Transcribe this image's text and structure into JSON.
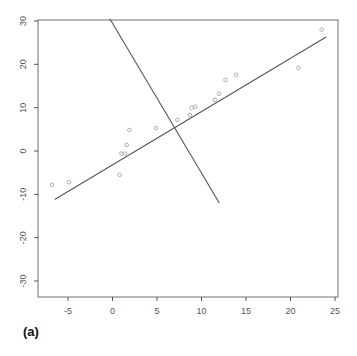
{
  "panel_label": "(a)",
  "colors": {
    "axis": "#555555",
    "box": "#888888",
    "line": "#555555",
    "point": "#999999"
  },
  "chart_data": {
    "type": "scatter",
    "title": "",
    "xlabel": "",
    "ylabel": "",
    "xlim": [
      -8,
      25.5
    ],
    "ylim": [
      -34,
      30.5
    ],
    "xticks": [
      -5,
      0,
      5,
      10,
      15,
      20,
      25
    ],
    "yticks": [
      -30,
      -20,
      -10,
      0,
      10,
      20,
      30
    ],
    "grid": false,
    "legend": null,
    "points": [
      {
        "x": -6.8,
        "y": -7.8
      },
      {
        "x": -4.9,
        "y": -7.2
      },
      {
        "x": 0.8,
        "y": -5.5
      },
      {
        "x": 1.0,
        "y": -0.6
      },
      {
        "x": 1.4,
        "y": -0.6
      },
      {
        "x": 1.6,
        "y": 1.4
      },
      {
        "x": 1.9,
        "y": 4.8
      },
      {
        "x": 4.9,
        "y": 5.3
      },
      {
        "x": 7.3,
        "y": 7.2
      },
      {
        "x": 8.7,
        "y": 8.3
      },
      {
        "x": 8.9,
        "y": 10.0
      },
      {
        "x": 9.3,
        "y": 10.2
      },
      {
        "x": 11.5,
        "y": 11.8
      },
      {
        "x": 12.0,
        "y": 13.2
      },
      {
        "x": 12.7,
        "y": 16.4
      },
      {
        "x": 13.9,
        "y": 17.6
      },
      {
        "x": 20.9,
        "y": 19.2
      },
      {
        "x": 23.5,
        "y": 28.0
      }
    ],
    "lines": [
      {
        "name": "principal-axis",
        "x": [
          -6.5,
          24.0
        ],
        "y": [
          -11.2,
          26.3
        ]
      },
      {
        "name": "perpendicular-axis",
        "x": [
          -0.3,
          12.0
        ],
        "y": [
          30.5,
          -12.0
        ]
      }
    ]
  }
}
